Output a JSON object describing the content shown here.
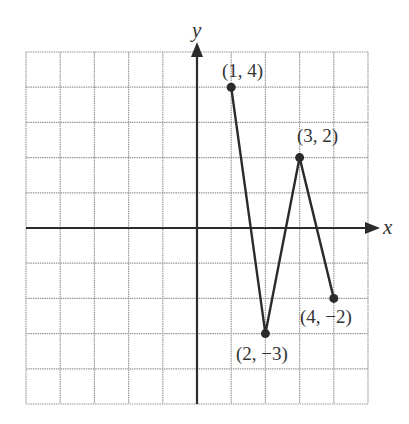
{
  "chart_data": {
    "type": "line",
    "title": "",
    "xlabel": "x",
    "ylabel": "y",
    "xlim": [
      -5,
      5
    ],
    "ylim": [
      -5,
      5
    ],
    "grid": true,
    "x": [
      1,
      2,
      3,
      4
    ],
    "series": [
      {
        "name": "piecewise-linear",
        "values": [
          4,
          -3,
          2,
          -2
        ]
      }
    ],
    "points": [
      {
        "x": 1,
        "y": 4,
        "label": "(1, 4)"
      },
      {
        "x": 2,
        "y": -3,
        "label": "(2, −3)"
      },
      {
        "x": 3,
        "y": 2,
        "label": "(3, 2)"
      },
      {
        "x": 4,
        "y": -2,
        "label": "(4, −2)"
      }
    ]
  },
  "axes": {
    "x_label": "x",
    "y_label": "y"
  },
  "labels": {
    "p1": "(1, 4)",
    "p2": "(2, −3)",
    "p3": "(3, 2)",
    "p4": "(4, −2)"
  },
  "colors": {
    "grid": "#9a9a9a",
    "axis": "#2b2b2b",
    "line": "#2b2b2b",
    "text": "#333333"
  }
}
